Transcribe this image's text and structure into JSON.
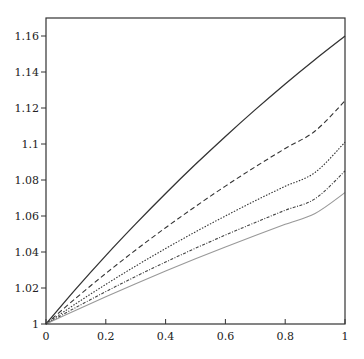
{
  "chart_data": {
    "type": "line",
    "title": "",
    "xlabel": "",
    "ylabel": "",
    "xlim": [
      0,
      1
    ],
    "ylim": [
      1,
      1.17
    ],
    "grid": false,
    "legend": null,
    "x_ticks": [
      0,
      0.2,
      0.4,
      0.6,
      0.8,
      1
    ],
    "x_tick_labels": [
      "0",
      "0.2",
      "0.4",
      "0.6",
      "0.8",
      "1"
    ],
    "y_ticks": [
      1,
      1.02,
      1.04,
      1.06,
      1.08,
      1.1,
      1.12,
      1.14,
      1.16
    ],
    "y_tick_labels": [
      "1",
      "1.02",
      "1.04",
      "1.06",
      "1.08",
      "1.1",
      "1.12",
      "1.14",
      "1.16"
    ],
    "x": [
      0,
      0.1,
      0.2,
      0.3,
      0.4,
      0.5,
      0.6,
      0.7,
      0.8,
      0.9,
      1.0
    ],
    "series": [
      {
        "name": "solid",
        "style": "solid",
        "color": "#333333",
        "values": [
          1.0,
          1.0195,
          1.038,
          1.0556,
          1.0725,
          1.0887,
          1.1042,
          1.1191,
          1.1334,
          1.147,
          1.16
        ]
      },
      {
        "name": "dashed",
        "style": "dashed",
        "color": "#333333",
        "values": [
          1.0,
          1.0144,
          1.0281,
          1.0411,
          1.0535,
          1.0653,
          1.0766,
          1.0873,
          1.0975,
          1.1072,
          1.124
        ]
      },
      {
        "name": "dotted",
        "style": "dotted",
        "color": "#333333",
        "values": [
          1.0,
          1.0113,
          1.022,
          1.0322,
          1.0419,
          1.0512,
          1.06,
          1.0685,
          1.0765,
          1.0842,
          1.101
        ]
      },
      {
        "name": "dash-dot",
        "style": "dashdot",
        "color": "#444444",
        "values": [
          1.0,
          1.0092,
          1.018,
          1.0264,
          1.0344,
          1.0421,
          1.0494,
          1.0564,
          1.0632,
          1.0696,
          1.085
        ]
      },
      {
        "name": "light",
        "style": "solid-light",
        "color": "#999999",
        "values": [
          1.0,
          1.0077,
          1.0152,
          1.0224,
          1.0294,
          1.0362,
          1.0428,
          1.0492,
          1.0554,
          1.0614,
          1.073
        ]
      }
    ]
  }
}
